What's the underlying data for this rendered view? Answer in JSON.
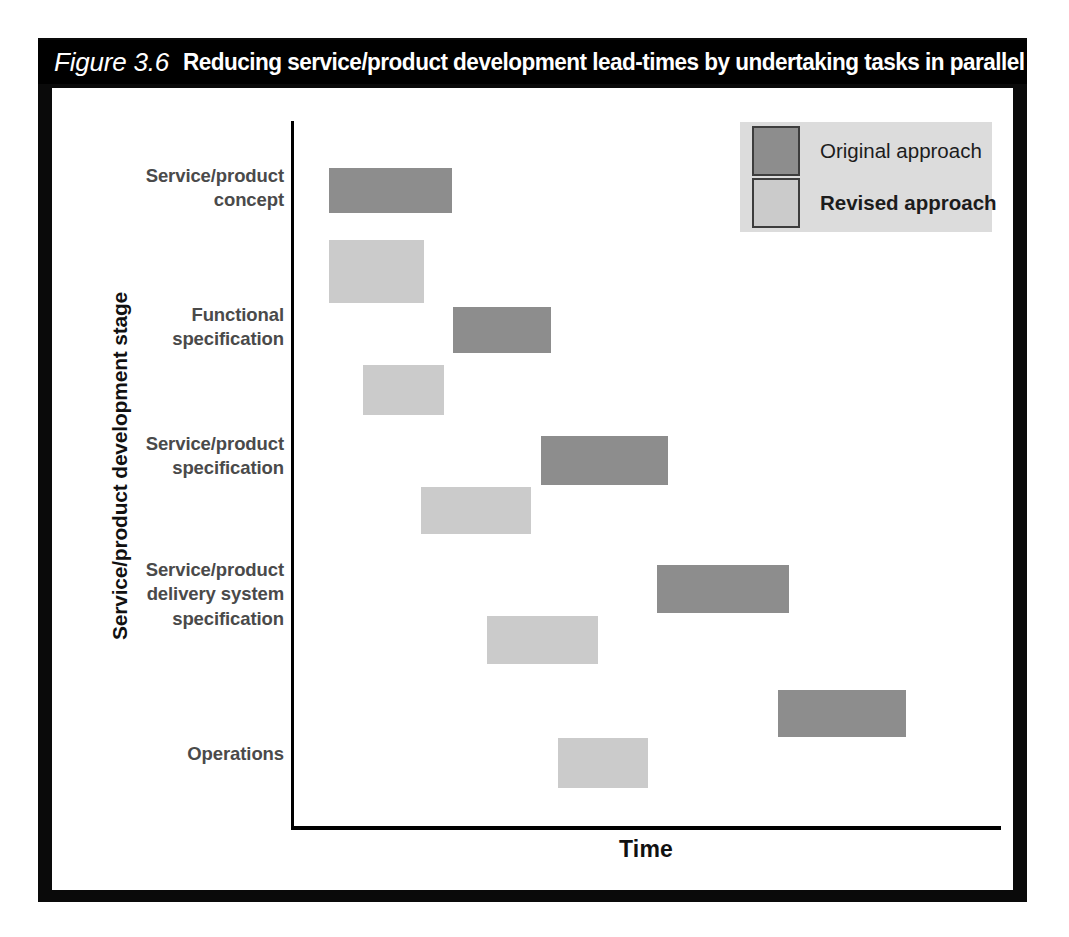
{
  "figure": {
    "number": "Figure 3.6",
    "caption": "Reducing service/product development lead-times by undertaking tasks in parallel"
  },
  "axes": {
    "y_title": "Service/product development stage",
    "x_title": "Time"
  },
  "legend": {
    "items": [
      {
        "label": "Original approach",
        "color": "#8d8d8d",
        "bold": false
      },
      {
        "label": "Revised approach",
        "color": "#cbcbcb",
        "bold": true
      }
    ]
  },
  "categories": [
    "Service/product\nconcept",
    "Functional\nspecification",
    "Service/product\nspecification",
    "Service/product\ndelivery system\nspecification",
    "Operations"
  ],
  "chart_data": {
    "type": "bar",
    "orientation": "horizontal",
    "subtype": "gantt",
    "title": "Reducing service/product development lead-times by undertaking tasks in parallel",
    "xlabel": "Time",
    "ylabel": "Service/product development stage",
    "grid": false,
    "legend_position": "top-right",
    "xlim": [
      0,
      710
    ],
    "axis_ticks": "none",
    "categories": [
      "Service/product concept",
      "Functional specification",
      "Service/product specification",
      "Service/product delivery system specification",
      "Operations"
    ],
    "series": [
      {
        "name": "Original approach",
        "color": "#8d8d8d",
        "bars": [
          {
            "category": "Service/product concept",
            "start": 38,
            "end": 161,
            "duration": 123
          },
          {
            "category": "Functional specification",
            "start": 162,
            "end": 260,
            "duration": 98
          },
          {
            "category": "Service/product specification",
            "start": 250,
            "end": 377,
            "duration": 127
          },
          {
            "category": "Service/product delivery system specification",
            "start": 366,
            "end": 498,
            "duration": 132
          },
          {
            "category": "Operations",
            "start": 487,
            "end": 615,
            "duration": 128
          }
        ]
      },
      {
        "name": "Revised approach",
        "color": "#cbcbcb",
        "bars": [
          {
            "category": "Service/product concept",
            "start": 38,
            "end": 133,
            "duration": 95
          },
          {
            "category": "Functional specification",
            "start": 72,
            "end": 153,
            "duration": 81
          },
          {
            "category": "Service/product specification",
            "start": 130,
            "end": 240,
            "duration": 110
          },
          {
            "category": "Service/product delivery system specification",
            "start": 196,
            "end": 307,
            "duration": 111
          },
          {
            "category": "Operations",
            "start": 267,
            "end": 357,
            "duration": 90
          }
        ]
      }
    ],
    "annotation": "Revised approach bars begin earlier and overlap, showing tasks undertaken in parallel to shorten total lead-time."
  },
  "bar_geometry": {
    "original": [
      {
        "left": 277,
        "top": 80,
        "width": 123,
        "height": 45
      },
      {
        "left": 401,
        "top": 219,
        "width": 98,
        "height": 46
      },
      {
        "left": 489,
        "top": 348,
        "width": 127,
        "height": 49
      },
      {
        "left": 605,
        "top": 477,
        "width": 132,
        "height": 48
      },
      {
        "left": 726,
        "top": 602,
        "width": 128,
        "height": 47
      }
    ],
    "revised": [
      {
        "left": 277,
        "top": 152,
        "width": 95,
        "height": 63
      },
      {
        "left": 311,
        "top": 277,
        "width": 81,
        "height": 50
      },
      {
        "left": 369,
        "top": 399,
        "width": 110,
        "height": 47
      },
      {
        "left": 435,
        "top": 528,
        "width": 111,
        "height": 48
      },
      {
        "left": 506,
        "top": 650,
        "width": 90,
        "height": 50
      }
    ],
    "label_tops": [
      76,
      215,
      344,
      470,
      654
    ]
  }
}
